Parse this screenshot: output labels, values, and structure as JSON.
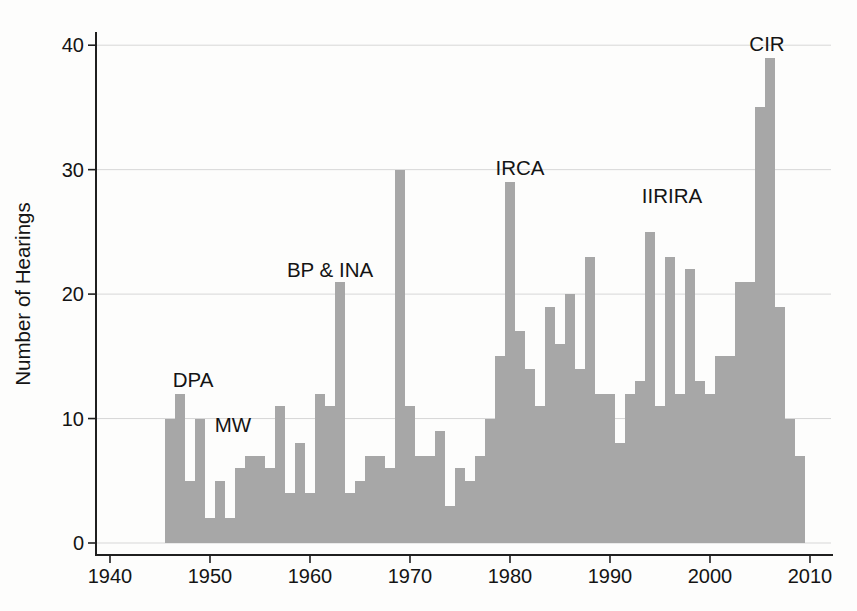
{
  "chart_data": {
    "type": "bar",
    "title": "",
    "xlabel": "",
    "ylabel": "Number of Hearings",
    "grid": "horizontal-only",
    "legend": "none",
    "xlim": [
      1938.6,
      2012.2
    ],
    "ylim": [
      0,
      41
    ],
    "x_ticks": [
      1940,
      1950,
      1960,
      1970,
      1980,
      1990,
      2000,
      2010
    ],
    "y_ticks": [
      0,
      10,
      20,
      30,
      40
    ],
    "bar_color": "#a7a7a7",
    "grid_color": "#d7d7d7",
    "axis_color": "#1f1f1f",
    "text_color": "#141414",
    "background_color": "#fdfdfc",
    "categories": [
      1946,
      1947,
      1948,
      1949,
      1950,
      1951,
      1952,
      1953,
      1954,
      1955,
      1956,
      1957,
      1958,
      1959,
      1960,
      1961,
      1962,
      1963,
      1964,
      1965,
      1966,
      1967,
      1968,
      1969,
      1970,
      1971,
      1972,
      1973,
      1974,
      1975,
      1976,
      1977,
      1978,
      1979,
      1980,
      1981,
      1982,
      1983,
      1984,
      1985,
      1986,
      1987,
      1988,
      1989,
      1990,
      1991,
      1992,
      1993,
      1994,
      1995,
      1996,
      1997,
      1998,
      1999,
      2000,
      2001,
      2002,
      2003,
      2004,
      2005,
      2006,
      2007,
      2008,
      2009
    ],
    "values": [
      10,
      12,
      5,
      10,
      2,
      5,
      2,
      6,
      7,
      7,
      6,
      11,
      4,
      8,
      4,
      12,
      11,
      21,
      4,
      5,
      7,
      7,
      6,
      30,
      11,
      7,
      7,
      9,
      3,
      6,
      5,
      7,
      10,
      15,
      29,
      17,
      14,
      11,
      19,
      16,
      20,
      14,
      23,
      12,
      12,
      8,
      12,
      13,
      25,
      11,
      23,
      12,
      22,
      13,
      12,
      15,
      15,
      21,
      21,
      35,
      39,
      19,
      10,
      7
    ],
    "annotations": [
      {
        "label": "DPA",
        "year": 1948.3,
        "value": 12.5
      },
      {
        "label": "MW",
        "year": 1952.3,
        "value": 8.95
      },
      {
        "label": "BP & INA",
        "year": 1962.0,
        "value": 21.35
      },
      {
        "label": "IRCA",
        "year": 1981.0,
        "value": 29.6
      },
      {
        "label": "IIRIRA",
        "year": 1996.2,
        "value": 27.3
      },
      {
        "label": "CIR",
        "year": 2005.7,
        "value": 39.5
      }
    ]
  }
}
